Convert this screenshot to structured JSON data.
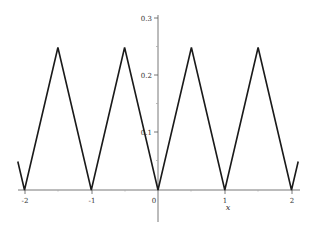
{
  "chart_data": {
    "type": "line",
    "title": "",
    "xlabel": "x",
    "ylabel": "",
    "xlim": [
      -2.1,
      2.1
    ],
    "ylim": [
      0,
      0.3
    ],
    "grid": false,
    "legend": null,
    "x_ticks": [
      "-2",
      "-1",
      "0",
      "1",
      "2"
    ],
    "y_ticks": [
      "0.1",
      "0.2",
      "0.3"
    ],
    "series": [
      {
        "name": "f(x)",
        "color": "#1a1a1a",
        "x": [
          -2.1,
          -2,
          -1.5,
          -1,
          -0.5,
          0,
          0.5,
          1,
          1.5,
          2,
          2.1
        ],
        "y": [
          0.05,
          0,
          0.25,
          0,
          0.25,
          0,
          0.25,
          0,
          0.25,
          0,
          0.05
        ]
      }
    ]
  },
  "labels": {
    "x_axis": "x",
    "x_ticks": [
      "-2",
      "-1",
      "0",
      "1",
      "2"
    ],
    "y_ticks": [
      "0.1",
      "0.2",
      "0.3"
    ]
  }
}
